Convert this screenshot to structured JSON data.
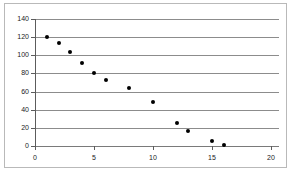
{
  "chart_data": {
    "type": "scatter",
    "title": "",
    "xlabel": "",
    "ylabel": "",
    "xlim": [
      0,
      20
    ],
    "ylim": [
      0,
      140
    ],
    "grid": true,
    "legend": null,
    "x_ticks": [
      0,
      5,
      10,
      15,
      20
    ],
    "x_tick_labels": [
      "0",
      "5",
      "10",
      "15",
      "20"
    ],
    "y_ticks": [
      0,
      20,
      40,
      60,
      80,
      100,
      120,
      140
    ],
    "y_tick_labels": [
      "0",
      "20",
      "40",
      "60",
      "80",
      "100",
      "120",
      "140"
    ],
    "x": [
      1,
      2,
      3,
      4,
      5,
      6,
      8,
      10,
      12,
      13,
      15,
      16
    ],
    "values": [
      120,
      114,
      104,
      91,
      80,
      73,
      64,
      48,
      25,
      16,
      6,
      1
    ],
    "marker": "filled-circle",
    "marker_color": "#000000",
    "gridline_color": "#8c8c8c",
    "axis_color": "#5c5c5c",
    "frame_color": "#b9b9b9",
    "background_color": "#ffffff"
  }
}
